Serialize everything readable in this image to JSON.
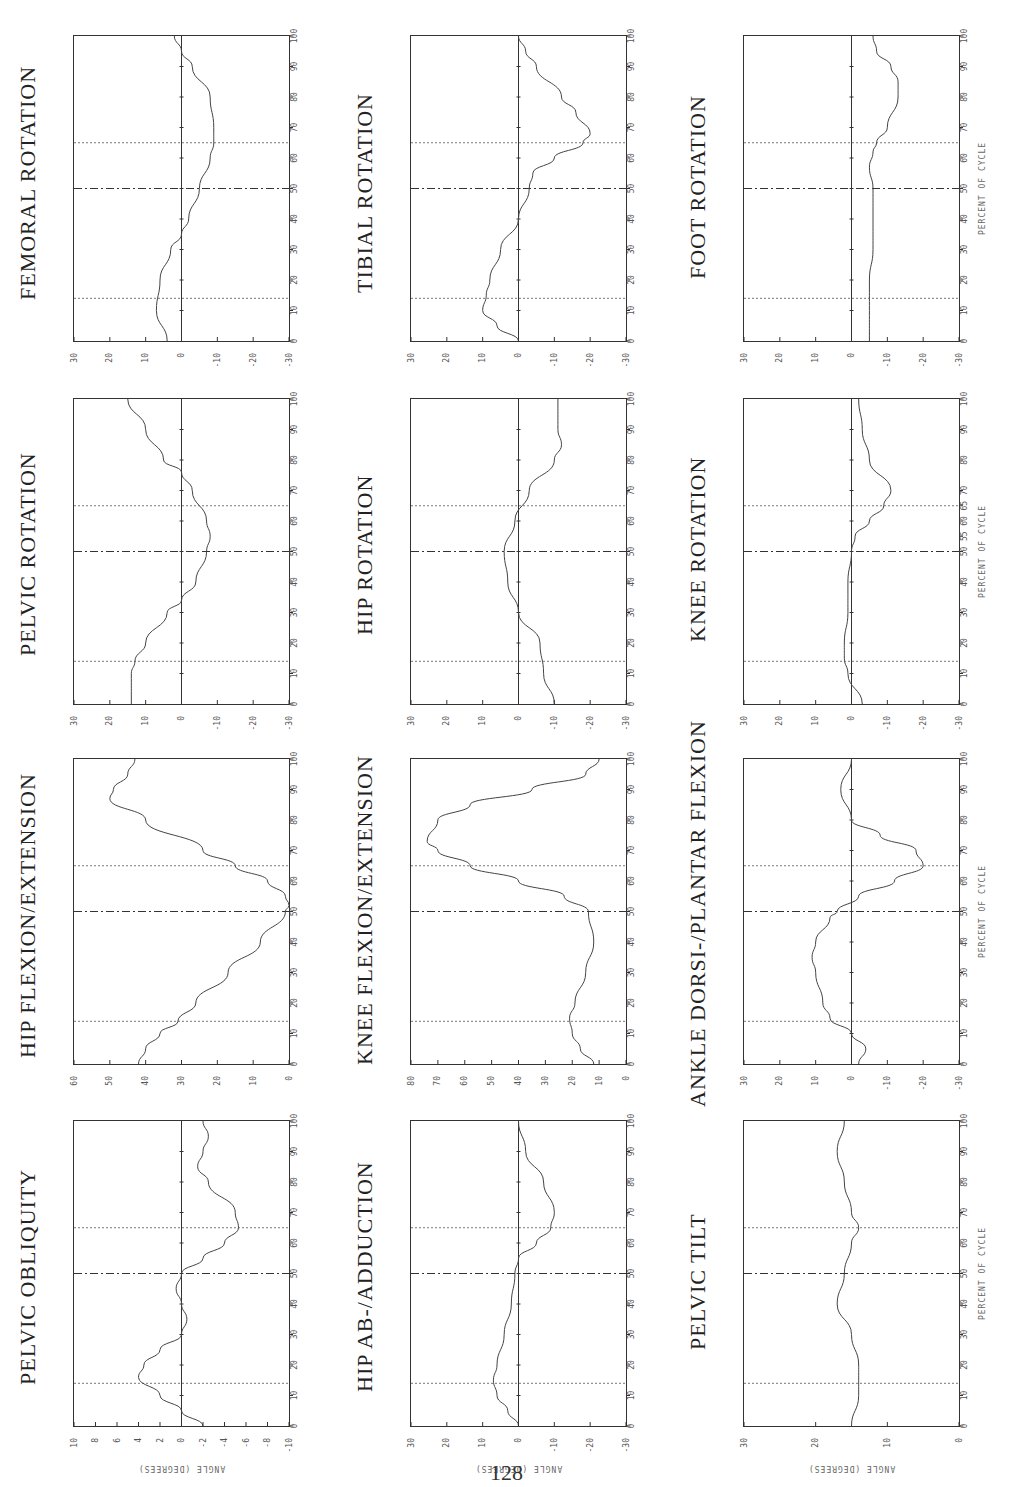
{
  "page": {
    "number": "128"
  },
  "axis_labels": {
    "x": "PERCENT OF CYCLE",
    "y": "ANGLE (DEGREES)"
  },
  "event_lines": {
    "toe_off_opposite": 14,
    "heel_strike_opposite": 50,
    "toe_off": 65
  },
  "chart_data": [
    {
      "type": "line",
      "title": "FEMORAL ROTATION",
      "row": 0,
      "col": 0,
      "xlabel": "PERCENT OF CYCLE",
      "ylabel": "ANGLE (DEGREES)",
      "xlim": [
        0,
        100
      ],
      "ylim": [
        -30,
        30
      ],
      "y_ticks": [
        "30",
        "20",
        "10",
        "0",
        "-10",
        "-20",
        "-30"
      ],
      "x_ticks": [
        "0",
        "10",
        "20",
        "30",
        "40",
        "50",
        "60",
        "70",
        "80",
        "90",
        "100"
      ],
      "x": [
        0,
        10,
        20,
        30,
        35,
        40,
        50,
        60,
        65,
        70,
        80,
        90,
        95,
        100
      ],
      "values": [
        4,
        7,
        6,
        3,
        0,
        -2,
        -5,
        -8,
        -9,
        -9,
        -8,
        -3,
        0,
        2
      ]
    },
    {
      "type": "line",
      "title": "TIBIAL ROTATION",
      "row": 0,
      "col": 1,
      "xlabel": "PERCENT OF CYCLE",
      "ylabel": "ANGLE (DEGREES)",
      "xlim": [
        0,
        100
      ],
      "ylim": [
        -30,
        30
      ],
      "y_ticks": [
        "30",
        "20",
        "10",
        "0",
        "-10",
        "-20",
        "-30"
      ],
      "x_ticks": [
        "0",
        "10",
        "20",
        "30",
        "40",
        "50",
        "60",
        "70",
        "80",
        "90",
        "100"
      ],
      "x": [
        0,
        5,
        10,
        15,
        20,
        30,
        40,
        50,
        55,
        60,
        65,
        68,
        75,
        80,
        90,
        95,
        100
      ],
      "values": [
        0,
        6,
        10,
        9,
        8,
        5,
        0,
        -3,
        -4,
        -10,
        -18,
        -20,
        -16,
        -12,
        -5,
        -2,
        0
      ]
    },
    {
      "type": "line",
      "title": "FOOT ROTATION",
      "row": 0,
      "col": 2,
      "xlabel": "PERCENT OF CYCLE",
      "ylabel": "ANGLE (DEGREES)",
      "xlim": [
        0,
        100
      ],
      "ylim": [
        -30,
        30
      ],
      "y_ticks": [
        "30",
        "20",
        "10",
        "0",
        "-10",
        "-20",
        "-30"
      ],
      "x_ticks": [
        "0",
        "10",
        "20",
        "30",
        "40",
        "50",
        "60",
        "70",
        "80",
        "90",
        "100"
      ],
      "x": [
        0,
        10,
        20,
        30,
        40,
        50,
        57,
        62,
        65,
        70,
        80,
        85,
        90,
        95,
        100
      ],
      "values": [
        -5,
        -5,
        -5,
        -6,
        -6,
        -6,
        -5,
        -6,
        -7,
        -10,
        -13,
        -13,
        -11,
        -7,
        -6
      ]
    },
    {
      "type": "line",
      "title": "PELVIC ROTATION",
      "row": 1,
      "col": 0,
      "xlabel": "PERCENT OF CYCLE",
      "ylabel": "ANGLE (DEGREES)",
      "xlim": [
        0,
        100
      ],
      "ylim": [
        -30,
        30
      ],
      "y_ticks": [
        "30",
        "20",
        "10",
        "0",
        "-10",
        "-20",
        "-30"
      ],
      "x_ticks": [
        "0",
        "10",
        "20",
        "30",
        "40",
        "50",
        "60",
        "70",
        "80",
        "90",
        "100"
      ],
      "x": [
        0,
        10,
        14,
        20,
        30,
        34,
        40,
        50,
        55,
        60,
        70,
        76,
        80,
        90,
        100
      ],
      "values": [
        14,
        14,
        13,
        10,
        4,
        0,
        -4,
        -7,
        -8,
        -7,
        -3,
        0,
        5,
        10,
        15
      ]
    },
    {
      "type": "line",
      "title": "HIP ROTATION",
      "row": 1,
      "col": 1,
      "xlabel": "PERCENT OF CYCLE",
      "ylabel": "ANGLE (DEGREES)",
      "xlim": [
        0,
        100
      ],
      "ylim": [
        -30,
        30
      ],
      "y_ticks": [
        "30",
        "20",
        "10",
        "0",
        "-10",
        "-20",
        "-30"
      ],
      "x_ticks": [
        "0",
        "10",
        "20",
        "30",
        "40",
        "50",
        "60",
        "70",
        "80",
        "90",
        "100"
      ],
      "x": [
        0,
        10,
        20,
        30,
        40,
        50,
        60,
        70,
        80,
        85,
        90,
        100
      ],
      "values": [
        -10,
        -7,
        -6,
        0,
        3,
        4,
        1,
        -3,
        -10,
        -12,
        -11,
        -11
      ]
    },
    {
      "type": "line",
      "title": "KNEE ROTATION",
      "row": 1,
      "col": 2,
      "xlabel": "PERCENT OF CYCLE",
      "ylabel": "ANGLE (DEGREES)",
      "xlim": [
        0,
        100
      ],
      "ylim": [
        -30,
        30
      ],
      "y_ticks": [
        "30",
        "20",
        "10",
        "0",
        "-10",
        "-20",
        "-30"
      ],
      "x_ticks": [
        "0",
        "10",
        "20",
        "30",
        "40",
        "50",
        "55",
        "60",
        "65",
        "70",
        "80",
        "90",
        "100"
      ],
      "x": [
        0,
        10,
        15,
        20,
        30,
        40,
        50,
        55,
        60,
        65,
        70,
        80,
        90,
        100
      ],
      "values": [
        -3,
        1,
        2,
        2,
        1,
        1,
        0,
        -1,
        -5,
        -9,
        -11,
        -5,
        -3,
        -2
      ]
    },
    {
      "type": "line",
      "title": "HIP FLEXION/EXTENSION",
      "row": 2,
      "col": 0,
      "xlabel": "PERCENT OF CYCLE",
      "ylabel": "ANGLE (DEGREES)",
      "xlim": [
        0,
        100
      ],
      "ylim": [
        0,
        60
      ],
      "y_ticks": [
        "60",
        "50",
        "40",
        "30",
        "20",
        "10",
        "0"
      ],
      "x_ticks": [
        "0",
        "10",
        "20",
        "30",
        "40",
        "50",
        "60",
        "70",
        "80",
        "90",
        "100"
      ],
      "x": [
        0,
        5,
        10,
        14,
        20,
        30,
        40,
        50,
        52,
        55,
        60,
        65,
        70,
        80,
        87,
        90,
        95,
        100
      ],
      "values": [
        42,
        40,
        36,
        31,
        26,
        17,
        8,
        1,
        0,
        1,
        6,
        15,
        24,
        40,
        50,
        49,
        45,
        43
      ]
    },
    {
      "type": "line",
      "title": "KNEE FLEXION/EXTENSION",
      "row": 2,
      "col": 1,
      "xlabel": "PERCENT OF CYCLE",
      "ylabel": "ANGLE (DEGREES)",
      "xlim": [
        0,
        80
      ],
      "ylim": [
        0,
        80
      ],
      "y_ticks": [
        "80",
        "70",
        "60",
        "50",
        "40",
        "30",
        "20",
        "10",
        "0"
      ],
      "x_ticks": [
        "0",
        "10",
        "20",
        "30",
        "40",
        "50",
        "60",
        "70",
        "80",
        "90",
        "100"
      ],
      "x": [
        0,
        5,
        10,
        15,
        20,
        30,
        40,
        50,
        55,
        60,
        65,
        70,
        73,
        80,
        85,
        90,
        95,
        100
      ],
      "values": [
        12,
        17,
        20,
        21,
        19,
        15,
        12,
        14,
        23,
        40,
        58,
        70,
        74,
        70,
        58,
        35,
        15,
        10
      ]
    },
    {
      "type": "line",
      "title": "ANKLE DORSI-/PLANTAR FLEXION",
      "row": 2,
      "col": 2,
      "xlabel": "PERCENT OF CYCLE",
      "ylabel": "ANGLE (DEGREES)",
      "xlim": [
        0,
        100
      ],
      "ylim": [
        -30,
        30
      ],
      "y_ticks": [
        "30",
        "20",
        "10",
        "0",
        "-10",
        "-20",
        "-30"
      ],
      "x_ticks": [
        "0",
        "10",
        "20",
        "30",
        "40",
        "50",
        "60",
        "70",
        "80",
        "90",
        "100"
      ],
      "x": [
        0,
        5,
        10,
        15,
        20,
        30,
        35,
        40,
        48,
        50,
        55,
        60,
        65,
        70,
        75,
        80,
        90,
        100
      ],
      "values": [
        -2,
        -4,
        0,
        6,
        8,
        10,
        11,
        10,
        6,
        4,
        -2,
        -12,
        -20,
        -18,
        -8,
        0,
        3,
        0
      ]
    },
    {
      "type": "line",
      "title": "PELVIC OBLIQUITY",
      "row": 3,
      "col": 0,
      "xlabel": "PERCENT OF CYCLE",
      "ylabel": "ANGLE (DEGREES)",
      "xlim": [
        0,
        100
      ],
      "ylim": [
        -10,
        10
      ],
      "y_ticks": [
        "10",
        "8",
        "6",
        "4",
        "2",
        "0",
        "-2",
        "-4",
        "-6",
        "-8",
        "-10"
      ],
      "x_ticks": [
        "0",
        "10",
        "20",
        "30",
        "40",
        "50",
        "60",
        "70",
        "80",
        "90",
        "100"
      ],
      "x": [
        0,
        5,
        10,
        16,
        20,
        25,
        30,
        35,
        40,
        45,
        50,
        55,
        60,
        65,
        70,
        80,
        85,
        90,
        95,
        100
      ],
      "values": [
        -2,
        0,
        2,
        4,
        3.5,
        2,
        0,
        -0.5,
        0,
        0.5,
        0,
        -2,
        -4,
        -5.3,
        -5,
        -2.5,
        -1.5,
        -2,
        -2.5,
        -2
      ]
    },
    {
      "type": "line",
      "title": "HIP AB-/ADDUCTION",
      "row": 3,
      "col": 1,
      "xlabel": "PERCENT OF CYCLE",
      "ylabel": "ANGLE (DEGREES)",
      "xlim": [
        0,
        100
      ],
      "ylim": [
        -30,
        30
      ],
      "y_ticks": [
        "30",
        "20",
        "10",
        "0",
        "-10",
        "-20",
        "-30"
      ],
      "x_ticks": [
        "0",
        "10",
        "20",
        "30",
        "40",
        "50",
        "60",
        "70",
        "80",
        "90",
        "100"
      ],
      "x": [
        0,
        5,
        10,
        15,
        20,
        30,
        40,
        50,
        55,
        60,
        65,
        70,
        80,
        90,
        100
      ],
      "values": [
        0,
        3,
        6,
        7,
        6,
        4,
        2,
        1,
        0,
        -5,
        -9,
        -10,
        -7,
        -2,
        0
      ]
    },
    {
      "type": "line",
      "title": "PELVIC TILT",
      "row": 3,
      "col": 2,
      "xlabel": "PERCENT OF CYCLE",
      "ylabel": "ANGLE (DEGREES)",
      "xlim": [
        0,
        100
      ],
      "ylim": [
        0,
        30
      ],
      "y_ticks": [
        "30",
        "20",
        "10",
        "0"
      ],
      "x_ticks": [
        "0",
        "10",
        "20",
        "30",
        "40",
        "50",
        "60",
        "70",
        "80",
        "90",
        "100"
      ],
      "x": [
        0,
        10,
        15,
        20,
        30,
        40,
        50,
        60,
        65,
        70,
        80,
        90,
        100
      ],
      "values": [
        15,
        14,
        14,
        14,
        15,
        17,
        16,
        15,
        14,
        15,
        16,
        17,
        16
      ]
    }
  ]
}
